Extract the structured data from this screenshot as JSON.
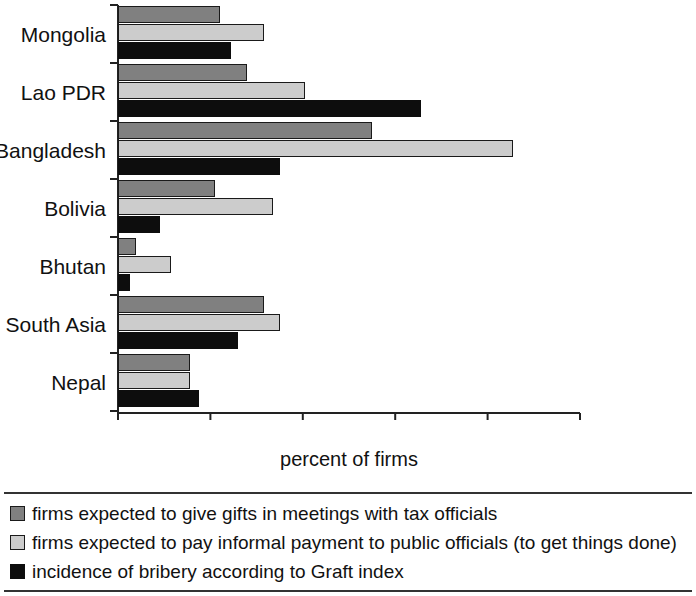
{
  "chart_data": {
    "type": "bar",
    "orientation": "horizontal",
    "title": "",
    "xlabel": "percent of firms",
    "ylabel": "",
    "xlim": [
      0,
      100
    ],
    "xticks": [
      0,
      20,
      40,
      60,
      80,
      100
    ],
    "xtick_labels": [
      "0",
      "20",
      "40",
      "60",
      "80",
      "100"
    ],
    "grid": false,
    "legend_position": "bottom",
    "categories": [
      "Mongolia",
      "Lao PDR",
      "Bangladesh",
      "Bolivia",
      "Bhutan",
      "South Asia",
      "Nepal"
    ],
    "series": [
      {
        "name": "firms expected to give gifts in meetings with tax officials",
        "color": "#808080",
        "values": [
          22,
          28,
          55,
          21,
          4,
          31.5,
          15.5
        ]
      },
      {
        "name": "firms expected to pay informal payment to public officials (to get things done)",
        "color": "#cccccc",
        "values": [
          31.5,
          40.5,
          85.5,
          33.5,
          11.5,
          35,
          15.5
        ]
      },
      {
        "name": "incidence of bribery according to Graft index",
        "color": "#0d0d0d",
        "values": [
          24.5,
          65.5,
          35,
          9,
          2.5,
          26,
          17.5
        ]
      }
    ]
  },
  "legend": {
    "items": [
      {
        "swatch": "dark-gray-swatch",
        "label": "firms expected to give gifts in meetings with tax officials"
      },
      {
        "swatch": "light-gray-swatch",
        "label": "firms expected to pay informal payment to public officials (to get things done)"
      },
      {
        "swatch": "black-swatch",
        "label": "incidence of bribery according to Graft index"
      }
    ]
  }
}
